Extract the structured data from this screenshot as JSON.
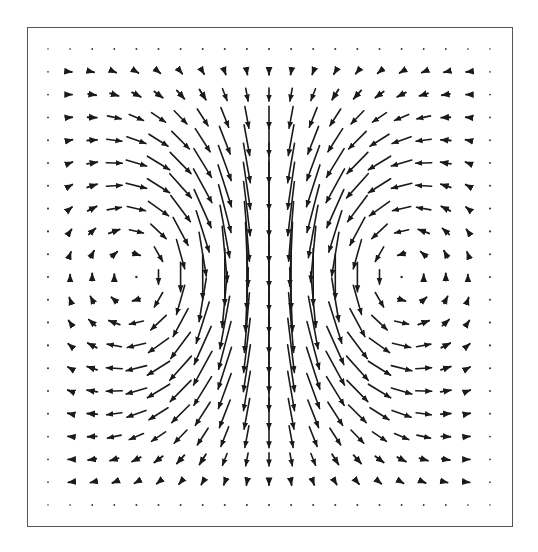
{
  "chart_data": {
    "type": "quiver",
    "title": "",
    "xlabel": "",
    "ylabel": "",
    "grid": false,
    "legend": null,
    "grid_size": {
      "cols": 21,
      "rows": 21
    },
    "x_range": [
      -1,
      1
    ],
    "y_range": [
      -1,
      1
    ],
    "vortices": [
      {
        "x": -0.4,
        "y": 0.0,
        "strength": 1.0,
        "core": 0.45
      },
      {
        "x": 0.4,
        "y": 0.0,
        "strength": -1.0,
        "core": 0.45
      }
    ],
    "center_column_direction": "up",
    "arrow_color": "#1a1a1a",
    "frame_color": "#555555",
    "pixel_layout": {
      "frame": {
        "left": 27,
        "top": 27,
        "right": 513,
        "bottom": 527
      },
      "grid_x_start": 48,
      "grid_x_end": 490,
      "grid_y_start": 49,
      "grid_y_end": 505,
      "max_arrow_px": 68
    }
  }
}
